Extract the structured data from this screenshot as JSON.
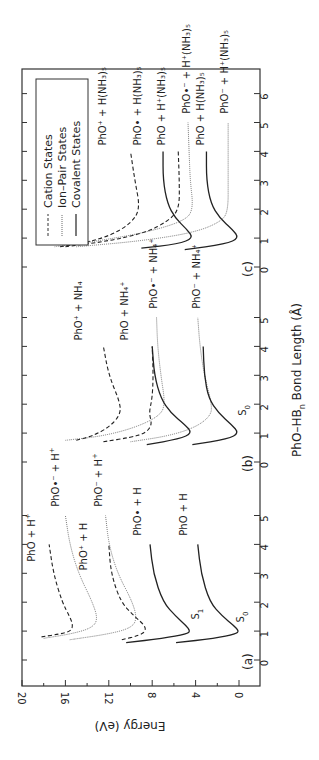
{
  "chart_data": {
    "type": "line",
    "orientation": "rotated-90-ccw",
    "xlabel": "PhO–HB_n Bond Length (Å)",
    "ylabel": "Energy (eV)",
    "ylim": [
      -2,
      20
    ],
    "yticks": [
      20,
      16,
      12,
      8,
      4,
      0
    ],
    "legend": {
      "position": "upper-left (rotated)",
      "entries": [
        {
          "label": "Cation States",
          "style": "dashed"
        },
        {
          "label": "Ion–Pair States",
          "style": "dotted"
        },
        {
          "label": "Covalent States",
          "style": "solid"
        }
      ]
    },
    "panels": [
      {
        "id": "a",
        "label": "(a)",
        "xticks": [
          0,
          1,
          2,
          3,
          4,
          5
        ],
        "zero_y": 660,
        "series": [
          {
            "name": "PhO + H⁺",
            "style": "dashed",
            "points": [
              [
                0.8,
                18.2
              ],
              [
                0.9,
                16.5
              ],
              [
                1.0,
                15.5
              ],
              [
                1.2,
                15.3
              ],
              [
                1.5,
                15.6
              ],
              [
                2.0,
                16.3
              ],
              [
                3.0,
                17.1
              ],
              [
                4.0,
                17.5
              ]
            ],
            "label_pos": [
              3.4,
              18.8
            ],
            "label_main": "PhO + H",
            "label_sup": "+"
          },
          {
            "name": "PhO•⁻ + H⁺",
            "style": "dotted",
            "points": [
              [
                0.75,
                18.0
              ],
              [
                0.9,
                15.5
              ],
              [
                1.1,
                13.6
              ],
              [
                1.4,
                13.0
              ],
              [
                2.0,
                13.5
              ],
              [
                3.0,
                14.8
              ],
              [
                4.0,
                15.6
              ],
              [
                5.0,
                16.0
              ]
            ],
            "label_pos": [
              5.3,
              16.6
            ],
            "label_main": "PhO•⁻ + H",
            "label_sup": "+"
          },
          {
            "name": "PhO⁺ + H",
            "style": "dashed",
            "points": [
              [
                0.7,
                10.8
              ],
              [
                0.85,
                9.2
              ],
              [
                1.0,
                8.6
              ],
              [
                1.2,
                8.7
              ],
              [
                1.5,
                9.6
              ],
              [
                2.0,
                10.9
              ],
              [
                3.0,
                11.8
              ],
              [
                4.0,
                12.0
              ]
            ],
            "label_pos": [
              3.1,
              14.0
            ],
            "label_main": "PhO⁺ + H",
            "label_sup": ""
          },
          {
            "name": "PhO⁻ + H⁺",
            "style": "dotted",
            "points": [
              [
                0.7,
                15.6
              ],
              [
                0.9,
                12.0
              ],
              [
                1.1,
                10.0
              ],
              [
                1.4,
                9.4
              ],
              [
                2.0,
                9.8
              ],
              [
                3.0,
                11.2
              ],
              [
                4.0,
                12.0
              ],
              [
                5.0,
                12.3
              ]
            ],
            "label_pos": [
              5.3,
              12.6
            ],
            "label_main": "PhO⁻ + H",
            "label_sup": "+"
          },
          {
            "name": "PhO• + H (S1)",
            "style": "solid",
            "points": [
              [
                0.6,
                10.4
              ],
              [
                0.75,
                7.0
              ],
              [
                0.9,
                4.8
              ],
              [
                1.0,
                4.5
              ],
              [
                1.2,
                4.9
              ],
              [
                1.5,
                5.8
              ],
              [
                2.0,
                7.0
              ],
              [
                3.0,
                7.9
              ],
              [
                4.0,
                8.2
              ]
            ],
            "label_pos": [
              4.3,
              9.0
            ],
            "label_main": "PhO• + H",
            "label_sup": ""
          },
          {
            "name": "PhO + H (S0)",
            "style": "solid",
            "points": [
              [
                0.6,
                5.8
              ],
              [
                0.75,
                2.2
              ],
              [
                0.9,
                0.3
              ],
              [
                1.0,
                0.0
              ],
              [
                1.2,
                0.5
              ],
              [
                1.5,
                1.5
              ],
              [
                2.0,
                2.7
              ],
              [
                3.0,
                3.5
              ],
              [
                4.0,
                3.8
              ]
            ],
            "label_pos": [
              4.3,
              4.8
            ],
            "label_main": "PhO + H",
            "label_sup": ""
          }
        ],
        "state_labels": [
          {
            "text": "S",
            "sub": "1",
            "R": 1.4,
            "E": 4.0
          },
          {
            "text": "S",
            "sub": "0",
            "R": 1.3,
            "E": -0.2
          }
        ]
      },
      {
        "id": "b",
        "label": "(b)",
        "xticks": [
          0,
          1,
          2,
          3,
          4,
          5
        ],
        "zero_y": 462,
        "series": [
          {
            "name": "PhO⁺ + NH₄",
            "style": "dashed",
            "points": [
              [
                0.75,
                15.0
              ],
              [
                0.9,
                13.5
              ],
              [
                1.2,
                12.0
              ],
              [
                1.6,
                11.0
              ],
              [
                2.0,
                10.9
              ],
              [
                3.0,
                12.0
              ],
              [
                4.0,
                12.5
              ]
            ],
            "label_pos": [
              4.2,
              14.5
            ],
            "label_main": "PhO⁺ + NH₄",
            "label_sup": ""
          },
          {
            "name": "PhO + NH₄⁺",
            "style": "dashed",
            "points": [
              [
                0.7,
                12.5
              ],
              [
                0.85,
                10.0
              ],
              [
                1.0,
                8.6
              ],
              [
                1.3,
                8.0
              ],
              [
                1.7,
                8.3
              ],
              [
                2.2,
                8.0
              ],
              [
                3.0,
                7.9
              ],
              [
                4.0,
                8.0
              ]
            ],
            "label_pos": [
              4.2,
              10.2
            ],
            "label_main": "PhO + NH₄⁺",
            "label_sup": ""
          },
          {
            "name": "PhO•⁻ + NH₄⁺",
            "style": "dotted",
            "points": [
              [
                0.75,
                16.0
              ],
              [
                0.9,
                12.5
              ],
              [
                1.2,
                9.5
              ],
              [
                1.6,
                7.3
              ],
              [
                2.0,
                6.8
              ],
              [
                3.0,
                7.2
              ],
              [
                4.0,
                7.5
              ],
              [
                5.0,
                7.6
              ]
            ],
            "label_pos": [
              5.3,
              7.6
            ],
            "label_main": "PhO•⁻ + NH₄⁺",
            "label_sup": ""
          },
          {
            "name": "PhO• + NH₄ (S1)",
            "style": "solid",
            "points": [
              [
                0.6,
                8.5
              ],
              [
                0.8,
                5.5
              ],
              [
                1.0,
                4.3
              ],
              [
                1.3,
                5.0
              ],
              [
                1.7,
                6.3
              ],
              [
                2.2,
                7.2
              ],
              [
                3.0,
                7.8
              ],
              [
                4.0,
                8.0
              ]
            ],
            "label_pos": null
          },
          {
            "name": "PhO⁻ + NH₄⁺",
            "style": "dotted",
            "points": [
              [
                0.7,
                10.0
              ],
              [
                0.9,
                6.5
              ],
              [
                1.2,
                4.0
              ],
              [
                1.6,
                2.6
              ],
              [
                2.0,
                2.5
              ],
              [
                3.0,
                3.2
              ],
              [
                4.0,
                3.6
              ],
              [
                5.0,
                3.8
              ]
            ],
            "label_pos": [
              5.3,
              3.6
            ],
            "label_main": "PhO⁻ + NH₄⁺",
            "label_sup": ""
          },
          {
            "name": "PhO + NH₄ (S0)",
            "style": "solid",
            "points": [
              [
                0.6,
                4.3
              ],
              [
                0.8,
                1.0
              ],
              [
                1.0,
                0.0
              ],
              [
                1.3,
                0.7
              ],
              [
                1.7,
                1.9
              ],
              [
                2.2,
                2.8
              ],
              [
                3.0,
                3.2
              ],
              [
                4.0,
                3.3
              ]
            ],
            "label_pos": null
          }
        ],
        "state_labels": [
          {
            "text": "S",
            "sub": "0",
            "R": 1.6,
            "E": -0.4
          }
        ]
      },
      {
        "id": "c",
        "label": "(c)",
        "xticks": [
          0,
          1,
          2,
          3,
          4,
          5,
          6
        ],
        "zero_y": 267,
        "series": [
          {
            "name": "PhO⁺ + H(NH₃)₅",
            "style": "dashed",
            "points": [
              [
                0.7,
                16.5
              ],
              [
                0.85,
                14.0
              ],
              [
                1.1,
                11.8
              ],
              [
                1.5,
                10.0
              ],
              [
                2.0,
                9.1
              ],
              [
                3.0,
                9.6
              ],
              [
                4.0,
                10.0
              ]
            ],
            "label_pos": [
              4.2,
              12.3
            ],
            "label_main": "PhO⁺ + H(NH₃)₅",
            "label_sup": ""
          },
          {
            "name": "PhO• + H(NH₃)₅",
            "style": "solid",
            "points": [
              [
                0.65,
                9.0
              ],
              [
                0.8,
                5.6
              ],
              [
                1.0,
                4.2
              ],
              [
                1.3,
                4.8
              ],
              [
                1.7,
                5.9
              ],
              [
                2.2,
                6.6
              ],
              [
                3.0,
                7.0
              ],
              [
                4.0,
                7.0
              ]
            ],
            "label_pos": [
              4.2,
              9.0
            ],
            "label_main": "PhO• + H(NH₃)₅",
            "label_sup": ""
          },
          {
            "name": "PhO + H⁺(NH₃)₅",
            "style": "dashed",
            "points": [
              [
                0.7,
                16.0
              ],
              [
                0.9,
                12.0
              ],
              [
                1.2,
                8.5
              ],
              [
                1.6,
                6.5
              ],
              [
                2.0,
                5.5
              ],
              [
                3.0,
                5.5
              ],
              [
                4.0,
                5.6
              ]
            ],
            "label_pos": [
              4.2,
              6.8
            ],
            "label_main": "PhO + H⁺(NH₃)₅",
            "label_sup": ""
          },
          {
            "name": "PhO•⁻ + H⁺(NH₃)₅",
            "style": "dotted",
            "points": [
              [
                0.7,
                17.0
              ],
              [
                0.9,
                13.0
              ],
              [
                1.2,
                8.5
              ],
              [
                1.6,
                5.0
              ],
              [
                2.0,
                4.2
              ],
              [
                3.0,
                4.5
              ],
              [
                4.0,
                4.6
              ],
              [
                5.0,
                4.7
              ]
            ],
            "label_pos": [
              5.3,
              4.5
            ],
            "label_main": "PhO•⁻ + H⁺(NH₃)₅",
            "label_sup": ""
          },
          {
            "name": "PhO + H(NH₃)₅",
            "style": "solid",
            "points": [
              [
                0.6,
                5.0
              ],
              [
                0.8,
                1.2
              ],
              [
                1.0,
                0.0
              ],
              [
                1.3,
                0.6
              ],
              [
                1.7,
                1.8
              ],
              [
                2.2,
                2.6
              ],
              [
                3.0,
                3.0
              ],
              [
                4.0,
                3.0
              ]
            ],
            "label_pos": [
              4.2,
              3.2
            ],
            "label_main": "PhO + H(NH₃)₅",
            "label_sup": ""
          },
          {
            "name": "PhO⁻ + H⁺(NH₃)₅",
            "style": "dotted",
            "points": [
              [
                0.7,
                15.0
              ],
              [
                0.9,
                9.0
              ],
              [
                1.2,
                4.0
              ],
              [
                1.6,
                1.5
              ],
              [
                2.0,
                1.0
              ],
              [
                3.0,
                1.0
              ],
              [
                4.0,
                1.0
              ],
              [
                5.0,
                1.0
              ]
            ],
            "label_pos": [
              5.3,
              1.0
            ],
            "label_main": "PhO⁻ + H⁺(NH₃)₅",
            "label_sup": ""
          }
        ],
        "state_labels": []
      }
    ]
  },
  "axes": {
    "x_title_main": "PhO–HB",
    "x_title_sub": "n",
    "x_title_rest": " Bond Length (Å)",
    "y_title": "Energy (eV)"
  },
  "legend": {
    "cation": "Cation States",
    "ion_pair": "Ion–Pair States",
    "covalent": "Covalent States"
  }
}
